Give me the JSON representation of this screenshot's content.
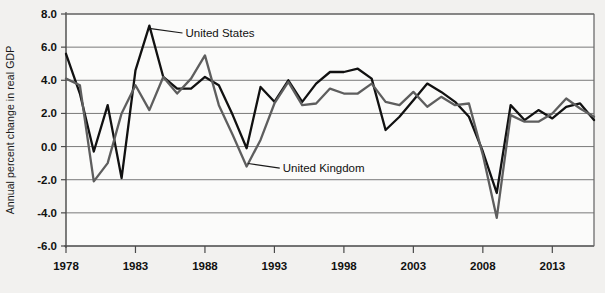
{
  "chart_data": {
    "type": "line",
    "title": "",
    "xlabel": "",
    "ylabel": "Annual percent change in real GDP",
    "ylim": [
      -6.0,
      8.0
    ],
    "xlim": [
      1978,
      2016
    ],
    "grid": true,
    "legend_position": "inline-annotation",
    "ytick_labels": [
      "8.0",
      "6.0",
      "4.0",
      "2.0",
      "0.0",
      "-2.0",
      "-4.0",
      "-6.0"
    ],
    "ytick_values": [
      8.0,
      6.0,
      4.0,
      2.0,
      0.0,
      -2.0,
      -4.0,
      -6.0
    ],
    "xtick_labels": [
      "1978",
      "1983",
      "1988",
      "1993",
      "1998",
      "2003",
      "2008",
      "2013"
    ],
    "xtick_values": [
      1978,
      1983,
      1988,
      1993,
      1998,
      2003,
      2008,
      2013
    ],
    "x": [
      1978,
      1979,
      1980,
      1981,
      1982,
      1983,
      1984,
      1985,
      1986,
      1987,
      1988,
      1989,
      1990,
      1991,
      1992,
      1993,
      1994,
      1995,
      1996,
      1997,
      1998,
      1999,
      2000,
      2001,
      2002,
      2003,
      2004,
      2005,
      2006,
      2007,
      2008,
      2009,
      2010,
      2011,
      2012,
      2013,
      2014,
      2015,
      2016
    ],
    "series": [
      {
        "name": "United States",
        "color": "#111111",
        "values": [
          5.6,
          3.2,
          -0.3,
          2.5,
          -1.9,
          4.6,
          7.3,
          4.2,
          3.5,
          3.5,
          4.2,
          3.7,
          1.9,
          -0.1,
          3.6,
          2.7,
          4.0,
          2.7,
          3.8,
          4.5,
          4.5,
          4.7,
          4.1,
          1.0,
          1.8,
          2.8,
          3.8,
          3.3,
          2.7,
          1.8,
          -0.3,
          -2.8,
          2.5,
          1.6,
          2.2,
          1.7,
          2.4,
          2.6,
          1.6
        ]
      },
      {
        "name": "United Kingdom",
        "color": "#5e5e5e",
        "values": [
          4.1,
          3.7,
          -2.1,
          -1.0,
          2.0,
          3.7,
          2.2,
          4.2,
          3.2,
          4.1,
          5.5,
          2.5,
          0.7,
          -1.2,
          0.4,
          2.6,
          3.9,
          2.5,
          2.6,
          3.5,
          3.2,
          3.2,
          3.8,
          2.7,
          2.5,
          3.3,
          2.4,
          3.0,
          2.5,
          2.6,
          -0.5,
          -4.3,
          1.9,
          1.5,
          1.5,
          2.0,
          2.9,
          2.3,
          1.8
        ]
      }
    ],
    "annotations": [
      {
        "label": "United States",
        "x_anchor": 1984,
        "y_anchor": 7.3,
        "text_x": 1986.6,
        "text_y": 6.85
      },
      {
        "label": "United Kingdom",
        "x_anchor": 1991,
        "y_anchor": -1.2,
        "text_x": 1993.6,
        "text_y": -1.3
      }
    ]
  }
}
